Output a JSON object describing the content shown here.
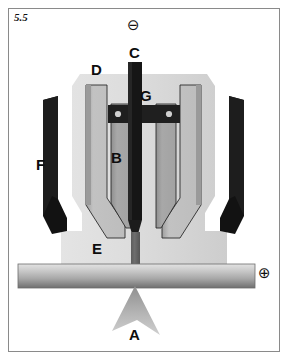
{
  "figure": {
    "number": "5.5"
  },
  "polarity": {
    "negative_symbol": "⊖",
    "negative_name": "circled-minus",
    "positive_symbol": "⊕",
    "positive_name": "circled-plus"
  },
  "callouts": [
    {
      "key": "A",
      "label": "A",
      "meaning": "plasma-arc-jet",
      "x": 129,
      "y": 327
    },
    {
      "key": "B",
      "label": "B",
      "meaning": "inner-gas-channel",
      "x": 111,
      "y": 150
    },
    {
      "key": "C",
      "label": "C",
      "meaning": "electrode-rod",
      "x": 129,
      "y": 45
    },
    {
      "key": "D",
      "label": "D",
      "meaning": "nozzle-body",
      "x": 91,
      "y": 62
    },
    {
      "key": "E",
      "label": "E",
      "meaning": "shield-cap",
      "x": 92,
      "y": 241
    },
    {
      "key": "F",
      "label": "F",
      "meaning": "outer-shield",
      "x": 36,
      "y": 157
    },
    {
      "key": "G",
      "label": "G",
      "meaning": "insulator-seal",
      "x": 140,
      "y": 88
    }
  ],
  "colors": {
    "frame_border": "#8a8a8a",
    "page_background": "#ffffff",
    "outer_body_light": "#d6d6d6",
    "nozzle_mid_gray": "#b7b7b7",
    "nozzle_inner_gray": "#9e9e9e",
    "nozzle_pale": "#cfcfcf",
    "electrode_dark": "#1c1c1c",
    "shield_black": "#111111",
    "workpiece_top": "#d9d9d9",
    "workpiece_bottom": "#7d7d7d",
    "arc_gray": "#b0b0b0",
    "outline_stroke": "#2b2b2b",
    "text": "#0d0d0d"
  },
  "parts": {
    "electrode_rod": "vertical dark electrode rod (C)",
    "gas_channel": "inner gas channel column (B)",
    "nozzle_body": "stepped nozzle body (D)",
    "shield_cap": "flared shield cap (E)",
    "outer_shield": "black outer shield bars (F)",
    "insulator_seal": "dark horizontal seal bar with two fasteners (G)",
    "workpiece": "horizontal workpiece bar",
    "plasma_jet": "plasma arc jet arrowhead (A)"
  }
}
